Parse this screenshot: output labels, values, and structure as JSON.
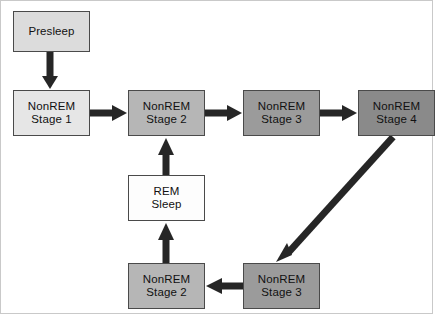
{
  "diagram": {
    "type": "flowchart",
    "canvas": {
      "width": 435,
      "height": 316,
      "background": "#ffffff"
    },
    "frame_color": "#c9c9c9",
    "arrow_color": "#262626",
    "border_color": "#4a4a4a",
    "shades": {
      "white": "#fdfdfd",
      "lighter": "#e6e6e6",
      "light": "#dcdcdc",
      "mid": "#b6b6b6",
      "dark": "#9b9b9b",
      "darker": "#8a8a8a"
    },
    "nodes": [
      {
        "id": "presleep",
        "line1": "Presleep",
        "line2": "",
        "x": 13,
        "y": 11,
        "w": 77,
        "h": 41,
        "shade": "light"
      },
      {
        "id": "nonrem1",
        "line1": "NonREM",
        "line2": "Stage 1",
        "x": 13,
        "y": 90,
        "w": 77,
        "h": 46,
        "shade": "lighter"
      },
      {
        "id": "nonrem2-top",
        "line1": "NonREM",
        "line2": "Stage 2",
        "x": 128,
        "y": 90,
        "w": 77,
        "h": 46,
        "shade": "mid"
      },
      {
        "id": "nonrem3-top",
        "line1": "NonREM",
        "line2": "Stage 3",
        "x": 243,
        "y": 90,
        "w": 77,
        "h": 46,
        "shade": "dark"
      },
      {
        "id": "nonrem4",
        "line1": "NonREM",
        "line2": "Stage 4",
        "x": 358,
        "y": 90,
        "w": 77,
        "h": 46,
        "shade": "darker"
      },
      {
        "id": "rem-sleep",
        "line1": "REM",
        "line2": "Sleep",
        "x": 128,
        "y": 175,
        "w": 77,
        "h": 46,
        "shade": "white"
      },
      {
        "id": "nonrem2-bottom",
        "line1": "NonREM",
        "line2": "Stage 2",
        "x": 128,
        "y": 263,
        "w": 77,
        "h": 46,
        "shade": "mid"
      },
      {
        "id": "nonrem3-bottom",
        "line1": "NonREM",
        "line2": "Stage 3",
        "x": 243,
        "y": 263,
        "w": 77,
        "h": 46,
        "shade": "dark"
      }
    ],
    "edges": [
      {
        "id": "presleep-to-stage1",
        "from": "presleep",
        "to": "nonrem1",
        "direction": "down"
      },
      {
        "id": "stage1-to-stage2",
        "from": "nonrem1",
        "to": "nonrem2-top",
        "direction": "right"
      },
      {
        "id": "stage2-to-stage3",
        "from": "nonrem2-top",
        "to": "nonrem3-top",
        "direction": "right"
      },
      {
        "id": "stage3-to-stage4",
        "from": "nonrem3-top",
        "to": "nonrem4",
        "direction": "right"
      },
      {
        "id": "stage4-to-stage3-bottom",
        "from": "nonrem4",
        "to": "nonrem3-bottom",
        "direction": "diagonal-down-left"
      },
      {
        "id": "stage3-bottom-to-stage2-bottom",
        "from": "nonrem3-bottom",
        "to": "nonrem2-bottom",
        "direction": "left"
      },
      {
        "id": "stage2-bottom-to-rem",
        "from": "nonrem2-bottom",
        "to": "rem-sleep",
        "direction": "up"
      },
      {
        "id": "rem-to-stage2-top",
        "from": "rem-sleep",
        "to": "nonrem2-top",
        "direction": "up"
      }
    ]
  }
}
